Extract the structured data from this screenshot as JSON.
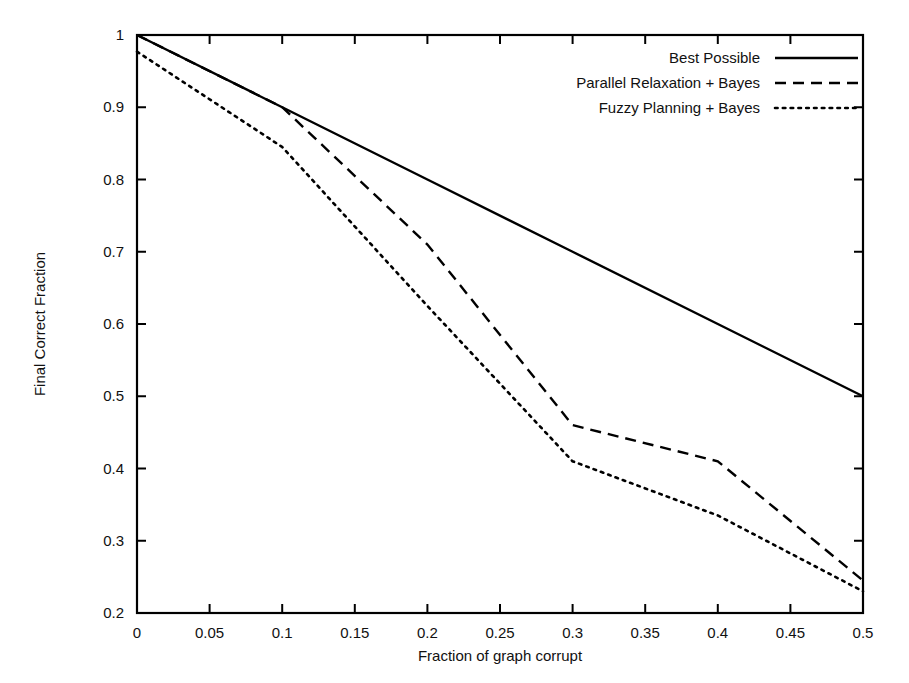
{
  "chart_data": {
    "type": "line",
    "title": "",
    "xlabel": "Fraction of graph corrupt",
    "ylabel": "Final Correct Fraction",
    "xlim": [
      0,
      0.5
    ],
    "ylim": [
      0.2,
      1.0
    ],
    "grid": false,
    "legend_position": "top-right inside",
    "xticks": [
      "0",
      "0.05",
      "0.1",
      "0.15",
      "0.2",
      "0.25",
      "0.3",
      "0.35",
      "0.4",
      "0.45",
      "0.5"
    ],
    "xtick_values": [
      0,
      0.05,
      0.1,
      0.15,
      0.2,
      0.25,
      0.3,
      0.35,
      0.4,
      0.45,
      0.5
    ],
    "yticks": [
      "0.2",
      "0.3",
      "0.4",
      "0.5",
      "0.6",
      "0.7",
      "0.8",
      "0.9",
      "1"
    ],
    "ytick_values": [
      0.2,
      0.3,
      0.4,
      0.5,
      0.6,
      0.7,
      0.8,
      0.9,
      1.0
    ],
    "series": [
      {
        "name": "Best Possible",
        "style": "solid",
        "color": "#000000",
        "x": [
          0,
          0.1,
          0.2,
          0.3,
          0.4,
          0.5
        ],
        "values": [
          1.0,
          0.9,
          0.8,
          0.7,
          0.6,
          0.5
        ]
      },
      {
        "name": "Parallel Relaxation + Bayes",
        "style": "dashed",
        "color": "#000000",
        "x": [
          0,
          0.1,
          0.2,
          0.3,
          0.4,
          0.5
        ],
        "values": [
          1.0,
          0.9,
          0.71,
          0.46,
          0.41,
          0.245
        ]
      },
      {
        "name": "Fuzzy Planning + Bayes",
        "style": "dotted",
        "color": "#000000",
        "x": [
          0,
          0.1,
          0.2,
          0.3,
          0.4,
          0.5
        ],
        "values": [
          0.977,
          0.845,
          0.625,
          0.41,
          0.335,
          0.23
        ]
      }
    ]
  },
  "legend": {
    "entries": [
      {
        "label": "Best Possible",
        "style": "solid"
      },
      {
        "label": "Parallel Relaxation + Bayes",
        "style": "dashed"
      },
      {
        "label": "Fuzzy Planning + Bayes",
        "style": "dotted"
      }
    ]
  },
  "colors": {
    "ink": "#000000",
    "background": "#ffffff"
  }
}
